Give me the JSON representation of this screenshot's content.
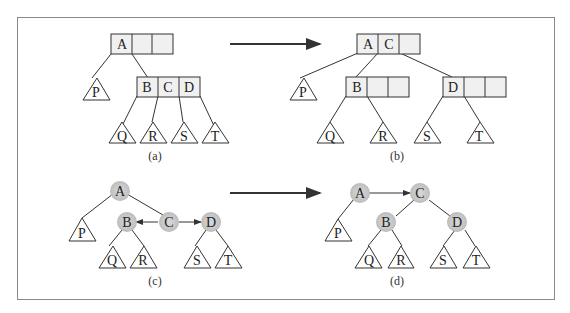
{
  "figure": {
    "panels": [
      {
        "id": "a",
        "caption": "(a)",
        "type": "2-3-4 tree",
        "root": {
          "keys": [
            "A",
            "",
            ""
          ]
        },
        "children": [
          {
            "subtree": "P"
          },
          {
            "keys": [
              "B",
              "C",
              "D"
            ],
            "subtrees": [
              "Q",
              "R",
              "S",
              "T"
            ]
          }
        ]
      },
      {
        "id": "b",
        "caption": "(b)",
        "type": "2-3-4 tree",
        "root": {
          "keys": [
            "A",
            "C",
            ""
          ]
        },
        "children": [
          {
            "subtree": "P"
          },
          {
            "keys": [
              "B",
              "",
              ""
            ],
            "subtrees": [
              "Q",
              "R"
            ]
          },
          {
            "keys": [
              "D",
              "",
              ""
            ],
            "subtrees": [
              "S",
              "T"
            ]
          }
        ]
      },
      {
        "id": "c",
        "caption": "(c)",
        "type": "red-black tree",
        "nodes": [
          "A",
          "B",
          "C",
          "D"
        ],
        "subtrees": [
          "P",
          "Q",
          "R",
          "S",
          "T"
        ]
      },
      {
        "id": "d",
        "caption": "(d)",
        "type": "red-black tree",
        "nodes": [
          "A",
          "C",
          "B",
          "D"
        ],
        "subtrees": [
          "P",
          "Q",
          "R",
          "S",
          "T"
        ]
      }
    ],
    "colors": {
      "node_fill": "#f0f0f0",
      "circle_fill": "#cfcfcf",
      "line": "#333333",
      "frame": "#8a8a8a"
    }
  }
}
